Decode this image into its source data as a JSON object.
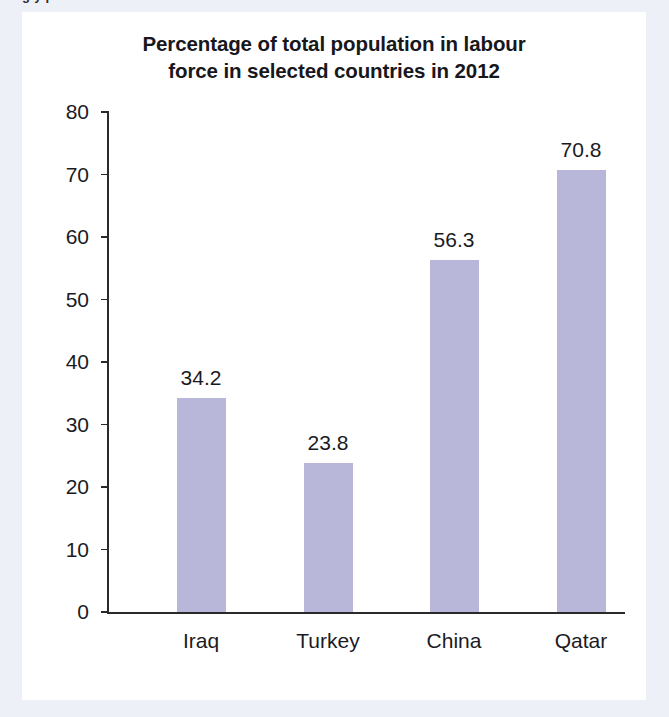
{
  "figure": {
    "title_line1": "Percentage of total population in labour",
    "title_line2": "force in selected countries in 2012",
    "cropped_top_text": "g  y     p",
    "bar_color": "#b8b6d9",
    "axis_color": "#2a2a2a",
    "text_color": "#1b1b1f",
    "panel_background": "#ffffff",
    "page_background": "#edf0f7"
  },
  "chart_data": {
    "type": "bar",
    "title": "Percentage of total population in labour force in selected countries in 2012",
    "xlabel": "",
    "ylabel": "",
    "categories": [
      "Iraq",
      "Turkey",
      "China",
      "Qatar"
    ],
    "values": [
      34.2,
      23.8,
      56.3,
      70.8
    ],
    "value_labels": [
      "34.2",
      "23.8",
      "56.3",
      "70.8"
    ],
    "ylim": [
      0,
      80
    ],
    "yticks": [
      0,
      10,
      20,
      30,
      40,
      50,
      60,
      70,
      80
    ],
    "ytick_labels": [
      "0",
      "10",
      "20",
      "30",
      "40",
      "50",
      "60",
      "70",
      "80"
    ],
    "grid": false,
    "legend": false,
    "series": [
      {
        "name": "Percentage of total population in labour force",
        "values": [
          34.2,
          23.8,
          56.3,
          70.8
        ]
      }
    ]
  }
}
